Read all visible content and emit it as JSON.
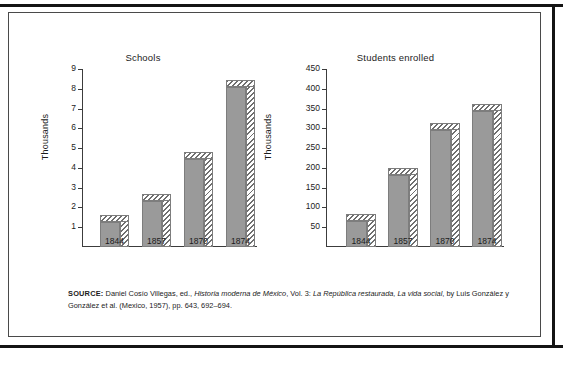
{
  "figure": {
    "source_note": {
      "lead": "SOURCE:",
      "part1": " Daniel Cosío Villegas, ed., ",
      "italic1": "Historia moderna de México",
      "part2": ", Vol. 3: ",
      "italic2": "La República restaurada, La vida social",
      "part3": ", by Luis González y González et al. (Mexico, 1957), pp. 643, 692–694."
    }
  },
  "chart_data": [
    {
      "type": "bar",
      "title": "Schools",
      "xlabel": "",
      "ylabel": "Thousands",
      "categories": [
        "1844",
        "1857",
        "1870",
        "1874"
      ],
      "values": [
        1.25,
        2.35,
        4.45,
        8.1
      ],
      "ylim": [
        0,
        9
      ],
      "yticks": [
        1,
        2,
        3,
        4,
        5,
        6,
        7,
        8,
        9
      ],
      "ytick_labels": [
        "1",
        "2",
        "3",
        "4",
        "5",
        "6",
        "7",
        "8",
        "9"
      ],
      "grid": false,
      "legend": "none",
      "style": "3d-bar-hatched-side"
    },
    {
      "type": "bar",
      "title": "Students enrolled",
      "xlabel": "",
      "ylabel": "Thousands",
      "categories": [
        "1844",
        "1857",
        "1870",
        "1874"
      ],
      "values": [
        65,
        182,
        297,
        345
      ],
      "ylim": [
        0,
        450
      ],
      "yticks": [
        50,
        100,
        150,
        200,
        250,
        300,
        350,
        400,
        450
      ],
      "ytick_labels": [
        "50",
        "100",
        "150",
        "200",
        "250",
        "300",
        "350",
        "400",
        "450"
      ],
      "grid": false,
      "legend": "none",
      "style": "3d-bar-hatched-side"
    }
  ],
  "colors": {
    "bar_face": "#9a9a9a",
    "bar_edge": "#7d7d7d",
    "hatch": "#6f6f6f",
    "axis": "#3c3c3c",
    "text": "#1b1b1b",
    "background": "#ffffff",
    "rule": "#141414"
  }
}
